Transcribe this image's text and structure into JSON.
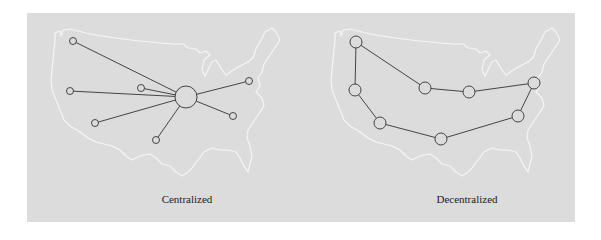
{
  "figure": {
    "background_color": "#dcdcdc",
    "map_outline_color": "#f5f5f5",
    "edge_color": "#333333",
    "node_stroke_color": "#333333",
    "node_fill_color": "#dcdcdc"
  },
  "panels": [
    {
      "id": "centralized",
      "caption": "Centralized",
      "topology": "star",
      "hub": {
        "x": 186,
        "y": 97,
        "r": 11
      },
      "nodes": [
        {
          "x": 73,
          "y": 41,
          "r": 3.5
        },
        {
          "x": 70,
          "y": 91,
          "r": 3.5
        },
        {
          "x": 141,
          "y": 88,
          "r": 3.5
        },
        {
          "x": 95,
          "y": 123,
          "r": 3.5
        },
        {
          "x": 156,
          "y": 140,
          "r": 3.5
        },
        {
          "x": 249,
          "y": 81,
          "r": 3.5
        },
        {
          "x": 233,
          "y": 116,
          "r": 3.5
        }
      ]
    },
    {
      "id": "decentralized",
      "caption": "Decentralized",
      "topology": "ring",
      "nodes": [
        {
          "x": 356,
          "y": 42,
          "r": 6
        },
        {
          "x": 425,
          "y": 88,
          "r": 6
        },
        {
          "x": 469,
          "y": 92,
          "r": 6
        },
        {
          "x": 534,
          "y": 83,
          "r": 6
        },
        {
          "x": 518,
          "y": 116,
          "r": 6
        },
        {
          "x": 441,
          "y": 139,
          "r": 6
        },
        {
          "x": 380,
          "y": 123,
          "r": 6
        },
        {
          "x": 355,
          "y": 90,
          "r": 6
        }
      ]
    }
  ]
}
